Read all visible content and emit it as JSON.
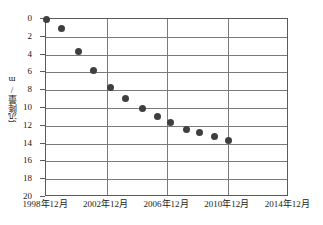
{
  "chart_data": {
    "type": "scatter",
    "title": "",
    "xlabel": "",
    "ylabel": "沉降量/m",
    "ylim": [
      0,
      20
    ],
    "y_inverted": true,
    "y_ticks": [
      0,
      2,
      4,
      6,
      8,
      10,
      12,
      14,
      16,
      18,
      20
    ],
    "x_tick_labels": [
      "1998年12月",
      "2002年12月",
      "2006年12月",
      "2010年12月",
      "2014年12月"
    ],
    "x_tick_years": [
      1998,
      2002,
      2006,
      2010,
      2014
    ],
    "xlim": [
      1998.95,
      2015.0
    ],
    "grid": true,
    "legend": "none",
    "marker_color": "#3f3f3f",
    "series": [
      {
        "name": "沉降量",
        "x": [
          1998.95,
          2000.0,
          2001.1,
          2002.1,
          2003.2,
          2004.2,
          2005.3,
          2006.3,
          2007.2,
          2008.2,
          2009.1,
          2010.1,
          2011.0
        ],
        "values": [
          0.0,
          1.1,
          3.6,
          5.8,
          7.7,
          8.9,
          10.1,
          11.0,
          11.6,
          12.4,
          12.8,
          13.2,
          13.6
        ]
      }
    ]
  }
}
